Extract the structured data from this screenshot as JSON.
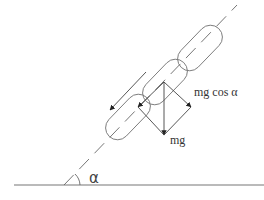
{
  "diagram": {
    "labels": {
      "normal_component": "mg cos α",
      "weight": "mg",
      "angle": "α"
    },
    "elements": {
      "ground_line": {
        "x1": 14,
        "y1": 185,
        "x2": 264,
        "y2": 185
      },
      "incline_axis": {
        "x1": 64,
        "y1": 185,
        "x2": 237,
        "y2": 5,
        "style": "dashed"
      },
      "angle_arc": {
        "cx": 64,
        "cy": 185,
        "r": 16
      },
      "capsules": [
        {
          "cx": 200,
          "cy": 48,
          "length": 54,
          "width": 24,
          "angle_deg": -46
        },
        {
          "cx": 165,
          "cy": 82,
          "length": 54,
          "width": 24,
          "angle_deg": -46
        },
        {
          "cx": 128,
          "cy": 117,
          "length": 54,
          "width": 24,
          "angle_deg": -46
        }
      ],
      "slope_arrow": {
        "x1": 146,
        "y1": 72,
        "x2": 110,
        "y2": 110
      },
      "force_origin": {
        "x": 164,
        "y": 82
      },
      "weight_vector_tip": {
        "x": 164,
        "y": 135
      },
      "normal_component_tip": {
        "x": 191,
        "y": 107
      },
      "tangential_component_tip": {
        "x": 138,
        "y": 107
      }
    },
    "colors": {
      "stroke": "#555555",
      "background": "#ffffff",
      "text": "#333333"
    }
  }
}
